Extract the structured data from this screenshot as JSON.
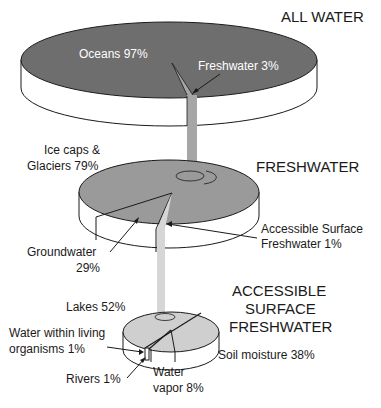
{
  "titles": {
    "all_water": "ALL WATER",
    "freshwater": "FRESHWATER",
    "accessible": [
      "ACCESSIBLE",
      "SURFACE",
      "FRESHWATER"
    ]
  },
  "all_water": {
    "oceans": "Oceans 97%",
    "freshwater": "Freshwater 3%"
  },
  "freshwater": {
    "ice_caps": [
      "Ice caps &",
      "Glaciers 79%"
    ],
    "groundwater": [
      "Groundwater",
      "29%"
    ],
    "accessible": [
      "Accessible Surface",
      "Freshwater 1%"
    ]
  },
  "accessible_surface": {
    "lakes": "Lakes 52%",
    "living": [
      "Water within living",
      "organisms 1%"
    ],
    "rivers": "Rivers 1%",
    "vapor": [
      "Water",
      "vapor 8%"
    ],
    "soil": "Soil moisture 38%"
  },
  "colors": {
    "top_disk": "#6e6e6e",
    "mid_disk": "#9a9a9a",
    "bottom_disk": "#cfcfcf",
    "stem": "#a6a6a6",
    "stem_light": "#d6d6d6",
    "edge": "#1a1a1a"
  }
}
